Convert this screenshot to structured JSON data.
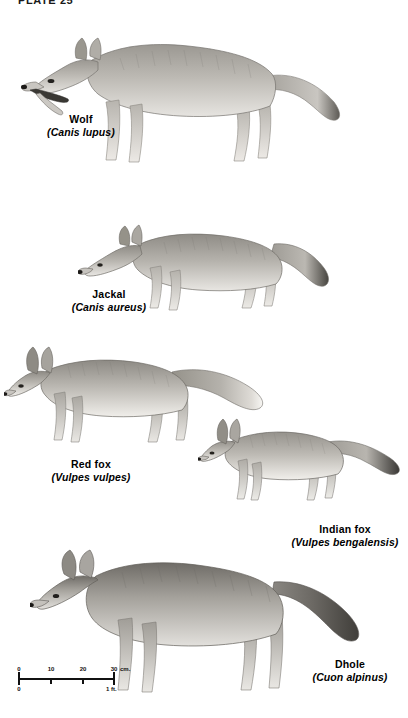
{
  "plate": {
    "header": "PLATE 25"
  },
  "figures": [
    {
      "id": "wolf",
      "common_name": "Wolf",
      "scientific_name": "(Canis lupus)",
      "pose": "standing, facing left, mouth open",
      "tail": "bushy, dark-tipped"
    },
    {
      "id": "jackal",
      "common_name": "Jackal",
      "scientific_name": "(Canis aureus)",
      "pose": "standing, facing left, head lowered",
      "tail": "bushy, dark-tipped"
    },
    {
      "id": "red-fox",
      "common_name": "Red fox",
      "scientific_name": "(Vulpes vulpes)",
      "pose": "standing, facing left",
      "tail": "long bushy, white-tipped"
    },
    {
      "id": "indian-fox",
      "common_name": "Indian fox",
      "scientific_name": "(Vulpes bengalensis)",
      "pose": "standing, facing left, small",
      "tail": "long, black-tipped"
    },
    {
      "id": "dhole",
      "common_name": "Dhole",
      "scientific_name": "(Cuon alpinus)",
      "pose": "standing, facing left",
      "tail": "bushy, dark"
    }
  ],
  "scale": {
    "cm_ticks": [
      "0",
      "10",
      "20",
      "30"
    ],
    "cm_unit": "cm.",
    "ft_start": "0",
    "ft_label": "1 ft."
  },
  "colors": {
    "ink": "#111111",
    "paper": "#ffffff",
    "fur_light": "#d8d6d2",
    "fur_mid": "#a9a69f",
    "fur_dark": "#6b6863",
    "fur_darkest": "#3b3935"
  }
}
